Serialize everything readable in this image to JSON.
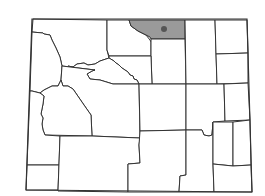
{
  "map": {
    "region": "Wyoming",
    "title": "",
    "colors": {
      "background": "#ffffff",
      "county_fill": "#ffffff",
      "county_stroke": "#333333",
      "highlight_fill": "#9a9a9a",
      "marker": "#555555"
    },
    "highlighted_county": "Sheridan",
    "marker": {
      "x": 164,
      "y": 29,
      "r": 3
    },
    "counties": [
      {
        "name": "Park",
        "highlight": false,
        "points": "33,19 107,20 107,50 109,58 100,61 95,64 88,65 84,63 77,64 73,67 68,66 66,70 62,66 60,57 56,48 52,40 50,35 44,34 43,33 32,32"
      },
      {
        "name": "Big Horn",
        "highlight": false,
        "points": "107,20 129,20 131,26 138,31 146,35 150,40 151,42 151,56 109,56 107,50"
      },
      {
        "name": "Sheridan",
        "highlight": true,
        "points": "129,20 185,20 185,39 151,39 150,37 146,35 138,31 131,26"
      },
      {
        "name": "Johnson",
        "highlight": false,
        "points": "151,39 185,39 186,84 152,84 151,56"
      },
      {
        "name": "Campbell",
        "highlight": false,
        "points": "185,20 215,20 217,84 186,84"
      },
      {
        "name": "Crook",
        "highlight": false,
        "points": "215,20 247,20 248,53 216,54"
      },
      {
        "name": "Weston",
        "highlight": false,
        "points": "216,54 248,53 248,83 217,84"
      },
      {
        "name": "Washakie",
        "highlight": false,
        "points": "109,56 151,56 152,84 139,84 137,80 134,79 133,76 130,75 128,72 125,70 122,68 119,65 116,63 114,61 109,58"
      },
      {
        "name": "Hot Springs",
        "highlight": false,
        "points": "62,66 66,70 68,66 73,67 77,64 84,63 88,65 95,64 100,61 109,58 114,61 116,63 119,65 122,68 125,70 128,72 130,75 133,76 134,79 137,80 139,84 113,84 100,80 90,79 87,74 92,71 95,70"
      },
      {
        "name": "Teton",
        "highlight": false,
        "points": "32,32 43,33 44,34 50,35 52,40 56,48 60,57 62,66 61,80 58,86 52,86 48,88 44,90 40,93 32,91 30,91"
      },
      {
        "name": "Fremont",
        "highlight": false,
        "points": "62,66 95,70 92,71 87,74 90,79 100,80 113,84 139,84 140,138 92,136 91,115 84,105 73,89 68,86 63,86 61,80"
      },
      {
        "name": "Sublette",
        "highlight": false,
        "points": "40,93 44,90 48,88 52,86 58,86 61,80 63,86 68,86 73,89 84,105 91,115 92,136 45,135 43,130 42,124 43,118 41,114 43,104 44,96"
      },
      {
        "name": "Lincoln",
        "highlight": false,
        "points": "30,91 32,91 40,93 44,96 43,104 41,114 43,118 42,124 43,130 45,135 60,136 59,165 27,165"
      },
      {
        "name": "Uinta",
        "highlight": false,
        "points": "27,165 59,165 58,190 26,190"
      },
      {
        "name": "Sweetwater",
        "highlight": false,
        "points": "60,136 92,136 140,138 139,145 140,163 128,164 128,192 58,191"
      },
      {
        "name": "Natrona",
        "highlight": false,
        "points": "139,84 186,84 186,130 140,131"
      },
      {
        "name": "Converse",
        "highlight": false,
        "points": "186,84 224,84 225,121 213,122 212,135 209,136 204,135 202,130 186,130"
      },
      {
        "name": "Niobrara",
        "highlight": false,
        "points": "224,84 248,83 250,120 225,121"
      },
      {
        "name": "Carbon",
        "highlight": false,
        "points": "140,131 186,130 186,175 180,176 179,192 128,192 128,164 140,163 139,145"
      },
      {
        "name": "Albany",
        "highlight": false,
        "points": "186,130 202,130 204,135 209,136 212,135 213,122 213,164 214,192 179,192 180,176 186,175"
      },
      {
        "name": "Platte",
        "highlight": false,
        "points": "213,122 233,122 233,166 213,164"
      },
      {
        "name": "Goshen",
        "highlight": false,
        "points": "233,122 250,120 251,165 233,166"
      },
      {
        "name": "Laramie",
        "highlight": false,
        "points": "213,164 233,166 251,165 252,192 214,192"
      }
    ]
  }
}
